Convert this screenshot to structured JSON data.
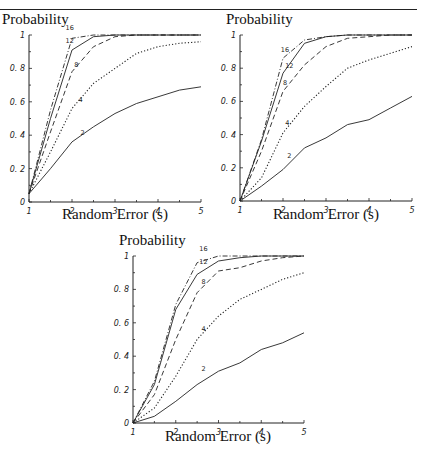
{
  "figure": {
    "top_rule": true
  },
  "chart_data": [
    {
      "type": "line",
      "title": "",
      "ylabel": "Probability",
      "xlabel": "Random Error (s)",
      "xlim": [
        1,
        5
      ],
      "ylim": [
        0,
        1
      ],
      "xticks": [
        "1",
        "2",
        "3",
        "4",
        "5"
      ],
      "yticks": [
        "0",
        "0.2",
        "0.4",
        "0.6",
        "0.8",
        "1"
      ],
      "grid": false,
      "legend": "inline curve labels",
      "x": [
        1,
        1.5,
        2,
        2.5,
        3,
        3.5,
        4,
        4.5,
        5
      ],
      "series": [
        {
          "name": "16",
          "style": "dashdot",
          "values": [
            0.05,
            0.55,
            0.98,
            1.0,
            1.0,
            1.0,
            1.0,
            1.0,
            1.0
          ]
        },
        {
          "name": "12",
          "style": "solid",
          "values": [
            0.05,
            0.5,
            0.91,
            0.99,
            1.0,
            1.0,
            1.0,
            1.0,
            1.0
          ]
        },
        {
          "name": "8",
          "style": "dashed",
          "values": [
            0.05,
            0.42,
            0.78,
            0.93,
            0.99,
            1.0,
            1.0,
            1.0,
            1.0
          ]
        },
        {
          "name": "4",
          "style": "dotted",
          "values": [
            0.05,
            0.3,
            0.56,
            0.71,
            0.8,
            0.89,
            0.93,
            0.95,
            0.96
          ]
        },
        {
          "name": "2",
          "style": "solid",
          "values": [
            0.05,
            0.2,
            0.36,
            0.45,
            0.53,
            0.59,
            0.63,
            0.67,
            0.69
          ]
        }
      ]
    },
    {
      "type": "line",
      "title": "",
      "ylabel": "Probability",
      "xlabel": "Random Error (s)",
      "xlim": [
        1,
        5
      ],
      "ylim": [
        0,
        1
      ],
      "xticks": [
        "1",
        "2",
        "3",
        "4",
        "5"
      ],
      "yticks": [
        "0",
        "0.2",
        "0.4",
        "0.6",
        "0.8",
        "1"
      ],
      "grid": false,
      "legend": "inline curve labels",
      "x": [
        1,
        1.5,
        2,
        2.5,
        3,
        3.5,
        4,
        4.5,
        5
      ],
      "series": [
        {
          "name": "16",
          "style": "dashdot",
          "values": [
            0.0,
            0.37,
            0.86,
            0.97,
            0.99,
            1.0,
            1.0,
            1.0,
            1.0
          ]
        },
        {
          "name": "12",
          "style": "solid",
          "values": [
            0.0,
            0.36,
            0.77,
            0.95,
            0.99,
            1.0,
            1.0,
            1.0,
            1.0
          ]
        },
        {
          "name": "8",
          "style": "dashed",
          "values": [
            0.0,
            0.3,
            0.66,
            0.82,
            0.93,
            0.98,
            0.99,
            1.0,
            1.0
          ]
        },
        {
          "name": "4",
          "style": "dotted",
          "values": [
            0.0,
            0.14,
            0.41,
            0.57,
            0.69,
            0.8,
            0.85,
            0.89,
            0.93
          ]
        },
        {
          "name": "2",
          "style": "solid",
          "values": [
            0.0,
            0.09,
            0.19,
            0.32,
            0.38,
            0.46,
            0.49,
            0.56,
            0.63
          ]
        }
      ]
    },
    {
      "type": "line",
      "title": "",
      "ylabel": "Probability",
      "xlabel": "Random Error (s)",
      "xlim": [
        1,
        5
      ],
      "ylim": [
        0,
        1
      ],
      "xticks": [
        "1",
        "2",
        "3",
        "4",
        "5"
      ],
      "yticks": [
        "0",
        "0.2",
        "0.4",
        "0.6",
        "0.8",
        "1"
      ],
      "grid": false,
      "legend": "inline curve labels",
      "x": [
        1,
        1.5,
        2,
        2.5,
        3,
        3.5,
        4,
        4.5,
        5
      ],
      "series": [
        {
          "name": "16",
          "style": "dashdot",
          "values": [
            0.0,
            0.25,
            0.71,
            0.96,
            1.0,
            1.0,
            1.0,
            1.0,
            1.0
          ]
        },
        {
          "name": "12",
          "style": "solid",
          "values": [
            0.0,
            0.23,
            0.68,
            0.89,
            0.97,
            0.99,
            1.0,
            1.0,
            1.0
          ]
        },
        {
          "name": "8",
          "style": "dashed",
          "values": [
            0.0,
            0.17,
            0.5,
            0.78,
            0.91,
            0.93,
            0.97,
            0.99,
            1.0
          ]
        },
        {
          "name": "4",
          "style": "dotted",
          "values": [
            0.0,
            0.09,
            0.28,
            0.5,
            0.64,
            0.74,
            0.8,
            0.86,
            0.9
          ]
        },
        {
          "name": "2",
          "style": "solid",
          "values": [
            0.0,
            0.04,
            0.13,
            0.23,
            0.31,
            0.36,
            0.44,
            0.48,
            0.54
          ]
        }
      ]
    }
  ],
  "layout": {
    "panels": [
      {
        "x0": 29,
        "x1": 201,
        "y0": 202,
        "y1": 35,
        "ylabel_x": 2,
        "ylabel_y": 24,
        "xlabel_x": 115,
        "xlabel_y": 219,
        "labels": [
          {
            "text": "16",
            "x": 1.85,
            "y": 1.03
          },
          {
            "text": "12",
            "x": 1.85,
            "y": 0.95
          },
          {
            "text": "8",
            "x": 2.05,
            "y": 0.81
          },
          {
            "text": "4",
            "x": 2.15,
            "y": 0.6
          },
          {
            "text": "2",
            "x": 2.2,
            "y": 0.4
          }
        ]
      },
      {
        "x0": 240,
        "x1": 412,
        "y0": 201,
        "y1": 35,
        "ylabel_x": 226,
        "ylabel_y": 24,
        "xlabel_x": 326,
        "xlabel_y": 219,
        "labels": [
          {
            "text": "16",
            "x": 1.95,
            "y": 0.9
          },
          {
            "text": "12",
            "x": 2.05,
            "y": 0.8
          },
          {
            "text": "8",
            "x": 2.0,
            "y": 0.7
          },
          {
            "text": "4",
            "x": 2.05,
            "y": 0.46
          },
          {
            "text": "2",
            "x": 2.1,
            "y": 0.26
          }
        ]
      },
      {
        "x0": 133,
        "x1": 304,
        "y0": 423,
        "y1": 256,
        "ylabel_x": 119,
        "ylabel_y": 245,
        "xlabel_x": 218,
        "xlabel_y": 441,
        "labels": [
          {
            "text": "16",
            "x": 2.55,
            "y": 1.03
          },
          {
            "text": "12",
            "x": 2.55,
            "y": 0.95
          },
          {
            "text": "8",
            "x": 2.6,
            "y": 0.83
          },
          {
            "text": "4",
            "x": 2.6,
            "y": 0.55
          },
          {
            "text": "2",
            "x": 2.6,
            "y": 0.31
          }
        ]
      }
    ]
  }
}
